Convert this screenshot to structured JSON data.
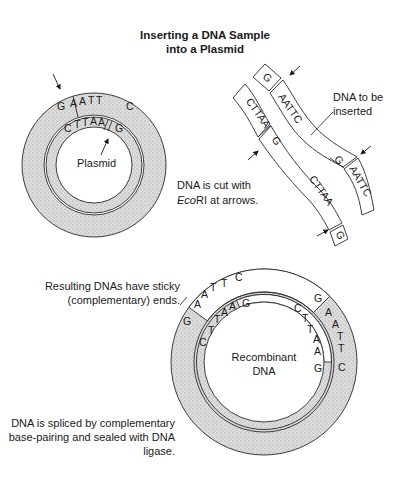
{
  "title": {
    "line1": "Inserting a DNA Sample",
    "line2": "into a Plasmid"
  },
  "plasmid": {
    "label": "Plasmid",
    "outer_bases": [
      "G",
      "A",
      "A",
      "T",
      "T",
      "C"
    ],
    "inner_bases": [
      "C",
      "T",
      "T",
      "A",
      "A",
      "G"
    ]
  },
  "insert": {
    "label_line1": "DNA to be",
    "label_line2": "inserted",
    "top_left_box": "G",
    "left_strand_top": "CTTAA",
    "right_strand_top": "AATTC",
    "left_strand_mid": "G",
    "right_strand_mid": "G",
    "left_strand_bottom": "CTTAA",
    "right_strand_bottom": "AATTC",
    "bottom_box": "G"
  },
  "cut_note": {
    "line1": "DNA is cut with",
    "line2_italic": "Eco",
    "line2_rest": "RI at arrows."
  },
  "sticky_note": {
    "line1": "Resulting DNAs have sticky",
    "line2": "(complementary) ends."
  },
  "recombinant": {
    "label_line1": "Recombinant",
    "label_line2": "DNA",
    "outer_left": [
      "G",
      "A",
      "A",
      "T",
      "T",
      "C"
    ],
    "inner_left": [
      "C",
      "T",
      "T",
      "A",
      "A",
      "G"
    ],
    "outer_right": [
      "G",
      "A",
      "A",
      "T",
      "T",
      "C"
    ],
    "inner_right": [
      "C",
      "T",
      "T",
      "A",
      "A",
      "G"
    ]
  },
  "splice_note": {
    "line1": "DNA is spliced by complementary",
    "line2": "base-pairing and sealed with DNA",
    "line3": "ligase."
  },
  "colors": {
    "stipple": "#d4d4d4",
    "line": "#2a2a2a"
  }
}
